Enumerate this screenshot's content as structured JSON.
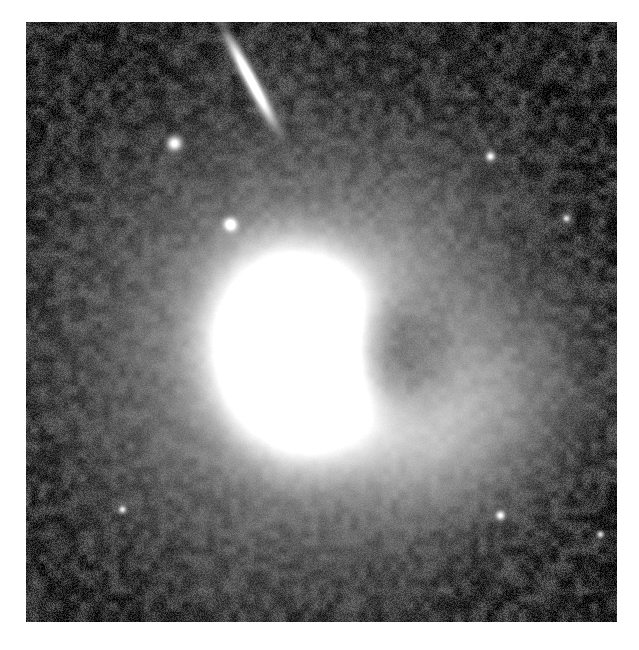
{
  "image": {
    "kind": "astronomical-photograph",
    "subject": "irregular starburst galaxy with companion",
    "color_mode": "grayscale",
    "alt_text": "Grayscale astronomical image of a bright irregular galaxy with a saturated white core, an asymmetric diffuse halo, a faint tidal plume toward the upper right, an edge-on companion galaxy streak at upper center, and several compact point sources on a noisy dark background.",
    "canvas": {
      "width": 639,
      "height": 650
    },
    "margin": {
      "left": 26,
      "top": 22,
      "right": 22,
      "bottom": 28
    },
    "plate": {
      "width": 591,
      "height": 600
    },
    "background": {
      "label": "noisy sky background",
      "base_level": 34,
      "noise_amplitude": 46,
      "darkest_hex": "#000000",
      "typical_hex": "#3a3a3a",
      "brightest_speckle_hex": "#9a9a9a"
    },
    "page_background_hex": "#ffffff"
  },
  "objects": [
    {
      "id": "main-galaxy",
      "label": "Main galaxy",
      "type": "irregular-starburst-galaxy",
      "center": {
        "x": 268,
        "y": 330
      },
      "core": {
        "label": "saturated core",
        "radius_x": 78,
        "radius_y": 98,
        "rotation_deg": -12,
        "peak_hex": "#ffffff"
      },
      "halo": {
        "label": "diffuse halo",
        "radius_x": 190,
        "radius_y": 200,
        "rotation_deg": -10,
        "level_hex": "#8a8a8a"
      },
      "outer_envelope": {
        "label": "outer envelope",
        "radius_x": 250,
        "radius_y": 255,
        "level_hex": "#5c5c5c"
      }
    },
    {
      "id": "companion-edge-on",
      "label": "Edge-on companion galaxy",
      "type": "edge-on-disk-galaxy",
      "center": {
        "x": 224,
        "y": 57
      },
      "length": 96,
      "width": 15,
      "angle_deg": 62,
      "peak_hex": "#ffffff"
    },
    {
      "id": "compact-source-a",
      "label": "Compact source A",
      "type": "compact-source",
      "center": {
        "x": 148,
        "y": 121
      },
      "radius": 8,
      "peak_hex": "#f2f2f2"
    },
    {
      "id": "compact-source-b",
      "label": "Compact source B",
      "type": "compact-source",
      "center": {
        "x": 204,
        "y": 202
      },
      "radius": 7,
      "peak_hex": "#eaeaea"
    },
    {
      "id": "point-source-c",
      "label": "Point source C",
      "type": "point-source",
      "center": {
        "x": 464,
        "y": 134
      },
      "radius": 5,
      "peak_hex": "#e0e0e0"
    },
    {
      "id": "point-source-d",
      "label": "Point source D",
      "type": "point-source",
      "center": {
        "x": 474,
        "y": 493
      },
      "radius": 5,
      "peak_hex": "#dcdcdc"
    },
    {
      "id": "point-source-e",
      "label": "Point source E",
      "type": "point-source",
      "center": {
        "x": 574,
        "y": 512
      },
      "radius": 4,
      "peak_hex": "#d6d6d6"
    },
    {
      "id": "point-source-f",
      "label": "Point source F",
      "type": "point-source",
      "center": {
        "x": 96,
        "y": 487
      },
      "radius": 4,
      "peak_hex": "#cccccc"
    },
    {
      "id": "point-source-g",
      "label": "Point source G",
      "type": "point-source",
      "center": {
        "x": 540,
        "y": 196
      },
      "radius": 4,
      "peak_hex": "#cfcfcf"
    }
  ],
  "features": [
    {
      "id": "tidal-plume",
      "label": "Tidal plume toward upper right",
      "type": "diffuse-extension",
      "from": {
        "x": 300,
        "y": 300
      },
      "to": {
        "x": 490,
        "y": 130
      },
      "width": 120,
      "level_hex": "#828282"
    },
    {
      "id": "east-extension",
      "label": "Eastern halo extension",
      "type": "diffuse-extension",
      "from": {
        "x": 300,
        "y": 330
      },
      "to": {
        "x": 470,
        "y": 360
      },
      "width": 150,
      "level_hex": "#8f8f8f"
    },
    {
      "id": "dark-notch",
      "label": "Dark notch intruding into core",
      "type": "absorption-feature",
      "center": {
        "x": 372,
        "y": 330
      },
      "radius_x": 58,
      "radius_y": 62,
      "level_hex": "#6a6a6a"
    },
    {
      "id": "south-east-lobe",
      "label": "South-east lobe",
      "type": "diffuse-extension",
      "center": {
        "x": 400,
        "y": 420
      },
      "radius_x": 90,
      "radius_y": 80,
      "level_hex": "#9c9c9c"
    }
  ]
}
